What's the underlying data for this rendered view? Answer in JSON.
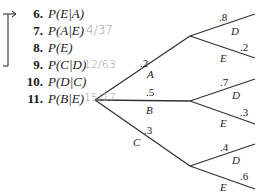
{
  "questions": [
    {
      "num": "6.",
      "expr": "P(E|A)",
      "answer": ""
    },
    {
      "num": "7.",
      "expr": "P(A|E)",
      "answer": "4/37"
    },
    {
      "num": "8.",
      "expr": "P(E)",
      "answer": ""
    },
    {
      "num": "9.",
      "expr": "P(C|D)",
      "answer": "12/63"
    },
    {
      "num": "10.",
      "expr": "P(D|C)",
      "answer": ""
    },
    {
      "num": "11.",
      "expr": "P(B|E)",
      "answer": "15/17"
    }
  ],
  "tree": {
    "first_level": [
      {
        "label": "A",
        "prob": ".2"
      },
      {
        "label": "B",
        "prob": ".5"
      },
      {
        "label": "C",
        "prob": ".3"
      }
    ],
    "second_level": [
      {
        "parent": "A",
        "branches": [
          {
            "label": "D",
            "prob": ".8"
          },
          {
            "label": "E",
            "prob": ".2"
          }
        ]
      },
      {
        "parent": "B",
        "branches": [
          {
            "label": "D",
            "prob": ".7"
          },
          {
            "label": "E",
            "prob": ".3"
          }
        ]
      },
      {
        "parent": "C",
        "branches": [
          {
            "label": "D",
            "prob": ".4"
          },
          {
            "label": "E",
            "prob": ".6"
          }
        ]
      }
    ]
  }
}
